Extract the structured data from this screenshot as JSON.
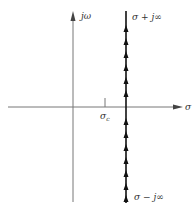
{
  "diagram": {
    "type": "complex-plane-contour",
    "axes": {
      "horizontal_label": "σ",
      "vertical_label": "jω"
    },
    "tick": {
      "label_main": "σ",
      "label_sub": "c"
    },
    "contour": {
      "top_label": "σ + j∞",
      "bottom_label": "σ − j∞",
      "direction": "upward",
      "arrow_count": 13
    },
    "colors": {
      "axis": "#777777",
      "contour": "#111111"
    }
  }
}
